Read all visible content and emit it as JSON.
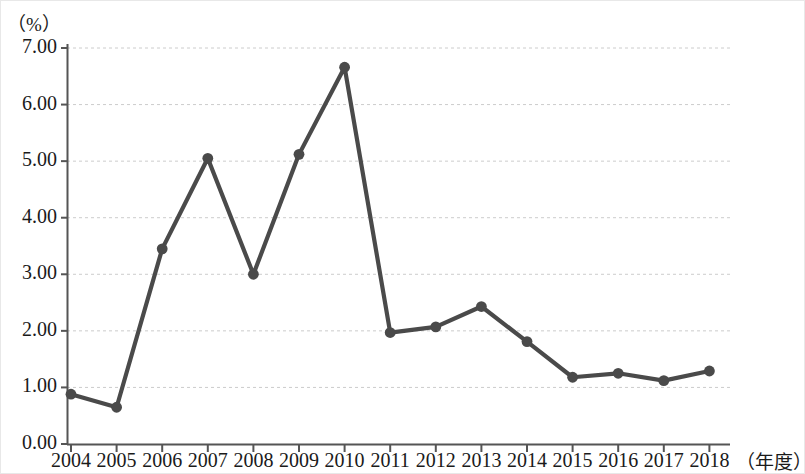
{
  "chart_data": {
    "type": "line",
    "title": "",
    "xlabel": "（年度）",
    "ylabel": "（%）",
    "categories": [
      "2004",
      "2005",
      "2006",
      "2007",
      "2008",
      "2009",
      "2010",
      "2011",
      "2012",
      "2013",
      "2014",
      "2015",
      "2016",
      "2017",
      "2018"
    ],
    "values": [
      0.88,
      0.65,
      3.45,
      5.05,
      3.0,
      5.12,
      6.66,
      1.97,
      2.07,
      2.43,
      1.81,
      1.18,
      1.25,
      1.12,
      1.29
    ],
    "series": [
      {
        "name": "",
        "values": [
          0.88,
          0.65,
          3.45,
          5.05,
          3.0,
          5.12,
          6.66,
          1.97,
          2.07,
          2.43,
          1.81,
          1.18,
          1.25,
          1.12,
          1.29
        ]
      }
    ],
    "ylim": [
      0,
      7
    ],
    "xlim_categories": [
      "2004",
      "2018"
    ],
    "ytick_labels": [
      "0.00",
      "1.00",
      "2.00",
      "3.00",
      "4.00",
      "5.00",
      "6.00",
      "7.00"
    ],
    "ytick_values": [
      0,
      1,
      2,
      3,
      4,
      5,
      6,
      7
    ],
    "xtick_labels": [
      "2004",
      "2005",
      "2006",
      "2007",
      "2008",
      "2009",
      "2010",
      "2011",
      "2012",
      "2013",
      "2014",
      "2015",
      "2016",
      "2017",
      "2018"
    ],
    "grid": "horizontal-dashed",
    "legend": "none",
    "line_color": "#4a4a4a",
    "marker_color": "#4a4a4a",
    "grid_color": "#cccccc",
    "axis_color": "#555555",
    "marker": "circle",
    "annotations": []
  }
}
